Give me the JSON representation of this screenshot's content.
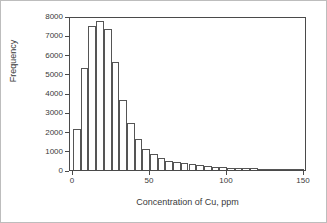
{
  "chart_data": {
    "type": "bar",
    "title": "",
    "subtitle": "",
    "xlabel": "Concentration of Cu, ppm",
    "ylabel": "Frequency",
    "xlim": [
      -2,
      152
    ],
    "ylim": [
      0,
      8000
    ],
    "grid": false,
    "legend": null,
    "bin_width": 5,
    "x_ticks": [
      0,
      50,
      100,
      150
    ],
    "x_tick_labels": [
      "0",
      "50",
      "100",
      "150"
    ],
    "y_ticks": [
      0,
      1000,
      2000,
      3000,
      4000,
      5000,
      6000,
      7000,
      8000
    ],
    "y_tick_labels": [
      "0",
      "1000",
      "2000",
      "3000",
      "4000",
      "5000",
      "6000",
      "7000",
      "8000"
    ],
    "bin_starts": [
      0,
      5,
      10,
      15,
      20,
      25,
      30,
      35,
      40,
      45,
      50,
      55,
      60,
      65,
      70,
      75,
      80,
      85,
      90,
      95,
      100,
      105,
      110,
      115,
      120,
      125,
      130,
      135,
      140,
      145
    ],
    "categories": [
      "0-5",
      "5-10",
      "10-15",
      "15-20",
      "20-25",
      "25-30",
      "30-35",
      "35-40",
      "40-45",
      "45-50",
      "50-55",
      "55-60",
      "60-65",
      "65-70",
      "70-75",
      "75-80",
      "80-85",
      "85-90",
      "90-95",
      "95-100",
      "100-105",
      "105-110",
      "110-115",
      "115-120",
      "120-125",
      "125-130",
      "130-135",
      "135-140",
      "140-145",
      "145-150"
    ],
    "values": [
      2120,
      5320,
      7470,
      7730,
      7340,
      5600,
      3620,
      2440,
      1600,
      1110,
      840,
      620,
      480,
      420,
      360,
      300,
      260,
      220,
      170,
      140,
      130,
      120,
      110,
      90,
      50,
      40,
      30,
      25,
      20,
      15
    ],
    "bar_fill_color": "#ffffff",
    "bar_edge_color": "#555555",
    "axis_color": "#4a4a4a",
    "text_color": "#3a3a3a",
    "background_color": "#ffffff"
  }
}
